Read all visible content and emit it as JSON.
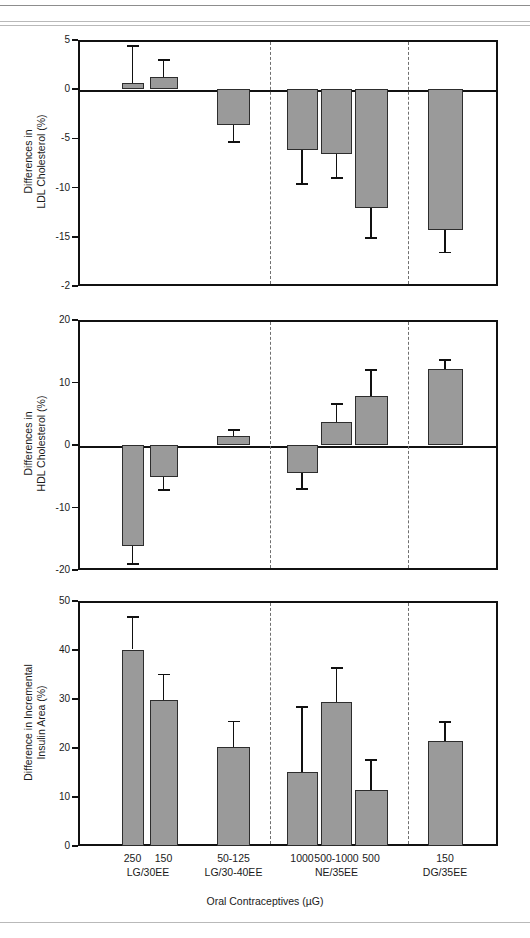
{
  "chart_data": [
    {
      "type": "bar",
      "title": "",
      "panel_index": 1,
      "ylabel": "Differences in\nLDL Cholesterol (%)",
      "ylabel_line1": "Differences in",
      "ylabel_line2": "LDL Cholesterol (%)",
      "xlabel": "",
      "ylim": [
        -20,
        5
      ],
      "yticks": [
        5,
        0,
        -5,
        -10,
        -15,
        -20
      ],
      "ytick_labels": [
        "5",
        "0",
        "-5",
        "-10",
        "-15",
        "-2"
      ],
      "grid": false,
      "legend": "none",
      "categories": [
        "250",
        "150",
        "50-125",
        "1000",
        "500-1000",
        "500",
        "150"
      ],
      "values": [
        0.6,
        1.2,
        -3.6,
        -6.2,
        -6.6,
        -12.1,
        -14.3
      ],
      "err_low": [
        -0.3,
        0.0,
        -5.4,
        -9.6,
        -9.0,
        -15.1,
        -16.6
      ],
      "err_high": [
        4.4,
        3.0,
        -3.6,
        -6.2,
        -6.6,
        -12.1,
        -14.3
      ]
    },
    {
      "type": "bar",
      "title": "",
      "panel_index": 2,
      "ylabel": "Differences in\nHDL Cholesterol (%)",
      "ylabel_line1": "Differences in",
      "ylabel_line2": "HDL Cholesterol (%)",
      "xlabel": "",
      "ylim": [
        -20,
        20
      ],
      "yticks": [
        20,
        10,
        0,
        -10,
        -20
      ],
      "ytick_labels": [
        "20",
        "10",
        "0",
        "-10",
        "-20"
      ],
      "grid": false,
      "legend": "none",
      "categories": [
        "250",
        "150",
        "50-125",
        "1000",
        "500-1000",
        "500",
        "150"
      ],
      "values": [
        -16.2,
        -5.1,
        1.5,
        -4.4,
        3.7,
        7.9,
        12.2
      ],
      "err_low": [
        -19.1,
        -7.2,
        1.5,
        -7.1,
        3.7,
        7.9,
        12.2
      ],
      "err_high": [
        -16.2,
        -5.1,
        2.4,
        -4.4,
        6.6,
        12.0,
        13.6
      ]
    },
    {
      "type": "bar",
      "title": "",
      "panel_index": 3,
      "ylabel": "Difference in Incremental\nInsulin Area (%)",
      "ylabel_line1": "Difference in Incremental",
      "ylabel_line2": "Insulin Area (%)",
      "xlabel": "Oral Contraceptives (µG)",
      "ylim": [
        0,
        50
      ],
      "yticks": [
        50,
        40,
        30,
        20,
        10,
        0
      ],
      "ytick_labels": [
        "50",
        "40",
        "30",
        "20",
        "10",
        "0"
      ],
      "grid": false,
      "legend": "none",
      "categories": [
        "250",
        "150",
        "50-125",
        "1000",
        "500-1000",
        "500",
        "150"
      ],
      "values": [
        40.1,
        29.7,
        20.2,
        15.1,
        29.4,
        11.5,
        21.5
      ],
      "err_low": [
        40.1,
        29.7,
        20.2,
        15.1,
        29.4,
        11.5,
        21.5
      ],
      "err_high": [
        46.7,
        35.0,
        25.4,
        28.3,
        36.4,
        17.6,
        25.3
      ]
    }
  ],
  "axis": {
    "x_title": "Oral Contraceptives (µG)",
    "categories": [
      {
        "dose": "250",
        "group": "LG/30EE"
      },
      {
        "dose": "150",
        "group": "LG/30EE"
      },
      {
        "dose": "50-125",
        "group": "LG/30-40EE"
      },
      {
        "dose": "1000",
        "group": "NE/35EE"
      },
      {
        "dose": "500-1000",
        "group": "NE/35EE"
      },
      {
        "dose": "500",
        "group": "NE/35EE"
      },
      {
        "dose": "150",
        "group": "DG/35EE"
      }
    ],
    "groups": [
      {
        "label": "LG/30EE"
      },
      {
        "label": "LG/30-40EE"
      },
      {
        "label": "NE/35EE"
      },
      {
        "label": "DG/35EE"
      }
    ]
  },
  "panel1": {
    "ytitle_line1": "Differences in",
    "ytitle_line2": "LDL Cholesterol (%)",
    "ticks": [
      "5",
      "0",
      "-5",
      "-10",
      "-15",
      "-2"
    ]
  },
  "panel2": {
    "ytitle_line1": "Differences in",
    "ytitle_line2": "HDL Cholesterol (%)",
    "ticks": [
      "20",
      "10",
      "0",
      "-10",
      "-20"
    ]
  },
  "panel3": {
    "ytitle_line1": "Difference in Incremental",
    "ytitle_line2": "Insulin Area (%)",
    "ticks": [
      "50",
      "40",
      "30",
      "20",
      "10",
      "0"
    ]
  },
  "colors": {
    "bar_fill": "#9a9a9a",
    "bar_stroke": "#2d2d2d",
    "axis": "#111111",
    "divider": "#6f6f6f"
  }
}
